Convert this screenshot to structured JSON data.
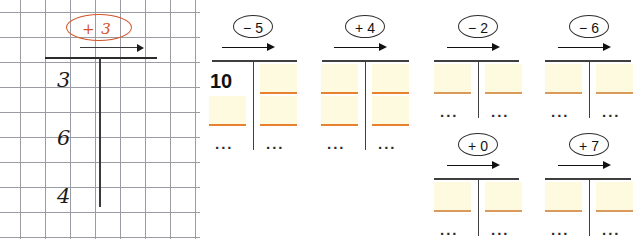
{
  "figure": {
    "background_color": "#ffffff"
  },
  "grid_paper": {
    "name": "squared-exercise-paper",
    "grid": {
      "cell_size_px": 25,
      "origin_x": 20,
      "origin_y": 12,
      "columns": 7,
      "rows": 10,
      "line_color": "#9b9ba3"
    },
    "annotation": {
      "label": "+ 3",
      "color": "#d4552a",
      "shape": "ellipse"
    },
    "arrow": {
      "icon": "arrow-right-icon",
      "color": "#111111"
    },
    "rule_line": {
      "color": "#2b2b2b"
    },
    "divider_line": {
      "color": "#3a3a3a"
    },
    "digits": [
      {
        "value": "3"
      },
      {
        "value": "6"
      },
      {
        "value": "4"
      }
    ]
  },
  "trees": [
    {
      "id": "tree-minus-5",
      "operation": "− 5",
      "arrow_icon": "arrow-right-icon",
      "left_column": {
        "entries": [
          {
            "type": "value",
            "text": "10"
          },
          {
            "type": "blank",
            "rule_color": "#e8812f"
          }
        ],
        "continuation": "..."
      },
      "right_column": {
        "entries": [
          {
            "type": "blank",
            "rule_color": "#e8812f"
          },
          {
            "type": "blank",
            "rule_color": "#e8812f"
          }
        ],
        "continuation": "..."
      }
    },
    {
      "id": "tree-plus-4",
      "operation": "+ 4",
      "arrow_icon": "arrow-right-icon",
      "left_column": {
        "entries": [
          {
            "type": "blank",
            "rule_color": "#e8812f"
          },
          {
            "type": "blank",
            "rule_color": "#e8812f"
          }
        ],
        "continuation": "..."
      },
      "right_column": {
        "entries": [
          {
            "type": "blank",
            "rule_color": "#e8812f"
          },
          {
            "type": "blank",
            "rule_color": "#e8812f"
          }
        ],
        "continuation": "..."
      }
    },
    {
      "id": "tree-minus-2",
      "operation": "− 2",
      "arrow_icon": "arrow-right-icon",
      "left_column": {
        "entries": [
          {
            "type": "blank",
            "rule_color": "#d99a5c"
          }
        ],
        "continuation": "..."
      },
      "right_column": {
        "entries": [
          {
            "type": "blank",
            "rule_color": "#d99a5c"
          }
        ],
        "continuation": "..."
      }
    },
    {
      "id": "tree-minus-6",
      "operation": "− 6",
      "arrow_icon": "arrow-right-icon",
      "left_column": {
        "entries": [
          {
            "type": "blank",
            "rule_color": "#d99a5c"
          }
        ],
        "continuation": "..."
      },
      "right_column": {
        "entries": [
          {
            "type": "blank",
            "rule_color": "#d99a5c"
          }
        ],
        "continuation": "..."
      }
    },
    {
      "id": "tree-plus-0",
      "operation": "+ 0",
      "arrow_icon": "arrow-right-icon",
      "left_column": {
        "entries": [
          {
            "type": "blank",
            "rule_color": "#d99a5c"
          }
        ],
        "continuation": "..."
      },
      "right_column": {
        "entries": [
          {
            "type": "blank",
            "rule_color": "#d99a5c"
          }
        ],
        "continuation": "..."
      }
    },
    {
      "id": "tree-plus-7",
      "operation": "+ 7",
      "arrow_icon": "arrow-right-icon",
      "left_column": {
        "entries": [
          {
            "type": "blank",
            "rule_color": "#d99a5c"
          }
        ],
        "continuation": "..."
      },
      "right_column": {
        "entries": [
          {
            "type": "blank",
            "rule_color": "#d99a5c"
          }
        ],
        "continuation": "..."
      }
    }
  ]
}
